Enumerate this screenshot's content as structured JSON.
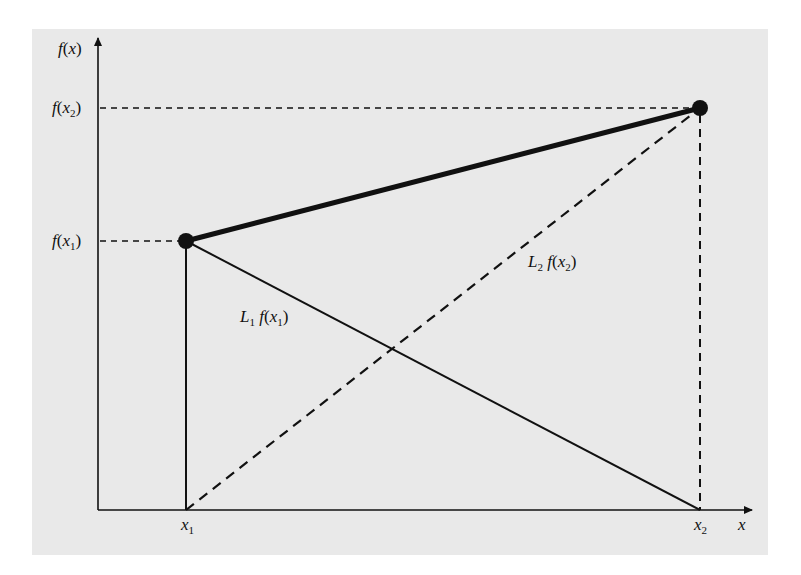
{
  "figure": {
    "kind": "linear-interpolation-lagrange-diagram",
    "background_color": "#e9e9e9",
    "line_color": "#111111"
  },
  "axes": {
    "y_label": "f(x)",
    "x_label": "x",
    "y_ticks": [
      {
        "id": "fx2",
        "label_fn": "f",
        "label_var": "x",
        "label_sub": "2"
      },
      {
        "id": "fx1",
        "label_fn": "f",
        "label_var": "x",
        "label_sub": "1"
      }
    ],
    "x_ticks": [
      {
        "id": "x1",
        "label_var": "x",
        "label_sub": "1"
      },
      {
        "id": "x2",
        "label_var": "x",
        "label_sub": "2"
      }
    ]
  },
  "points": [
    {
      "id": "p1",
      "x": "x1",
      "y": "f(x1)"
    },
    {
      "id": "p2",
      "x": "x2",
      "y": "f(x2)"
    }
  ],
  "lines": [
    {
      "id": "interpolant",
      "style": "thick-solid",
      "from": "p1",
      "to": "p2"
    },
    {
      "id": "L1f",
      "style": "solid",
      "from": "p1",
      "to": "x2-axis",
      "label_L": "L",
      "label_L_sub": "1",
      "label_fn": "f",
      "label_var": "x",
      "label_sub": "1"
    },
    {
      "id": "L2f",
      "style": "dashed",
      "from": "x1-axis",
      "to": "p2",
      "label_L": "L",
      "label_L_sub": "2",
      "label_fn": "f",
      "label_var": "x",
      "label_sub": "2"
    }
  ],
  "labels": {
    "fx_axis": {
      "fn": "f",
      "paren_open": "(",
      "var": "x",
      "paren_close": ")"
    },
    "x_axis": "x",
    "open": "(",
    "close": ")"
  }
}
